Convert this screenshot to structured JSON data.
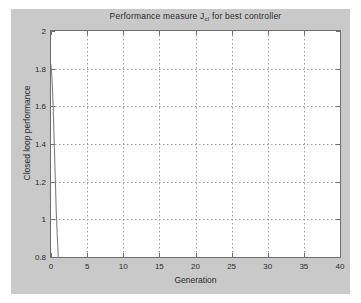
{
  "chart_data": {
    "type": "line",
    "title": "Performance measure J",
    "title_subscript": "cl",
    "title_suffix": " for best controller",
    "title_full": "Performance measure J_cl for best controller",
    "xlabel": "Generation",
    "ylabel": "Closed loop performance",
    "xlim": [
      0,
      40
    ],
    "ylim": [
      0.8,
      2
    ],
    "xticks": [
      "0",
      "5",
      "10",
      "15",
      "20",
      "25",
      "30",
      "35",
      "40"
    ],
    "xtick_values": [
      0,
      5,
      10,
      15,
      20,
      25,
      30,
      35,
      40
    ],
    "yticks": [
      "0.8",
      "1",
      "1.2",
      "1.4",
      "1.6",
      "1.8",
      "2"
    ],
    "ytick_values": [
      0.8,
      1.0,
      1.2,
      1.4,
      1.6,
      1.8,
      2.0
    ],
    "grid": true,
    "grid_style": "dotted",
    "legend": null,
    "series": [
      {
        "name": "best controller performance",
        "color": "#808080",
        "x": [
          0,
          0.15,
          0.3,
          0.45,
          0.6,
          0.72,
          0.85,
          1.0,
          1.2,
          2,
          3,
          4,
          5,
          5.6,
          6,
          7,
          8,
          9,
          10,
          11,
          12,
          13,
          14,
          15,
          15.4,
          16,
          17,
          18,
          20,
          22,
          24,
          26,
          28,
          30,
          32,
          34,
          36,
          38,
          40
        ],
        "y": [
          1.82,
          1.74,
          1.6,
          1.4,
          1.21,
          1.05,
          0.93,
          0.795,
          0.79,
          0.79,
          0.79,
          0.79,
          0.79,
          0.787,
          0.766,
          0.766,
          0.766,
          0.766,
          0.766,
          0.766,
          0.766,
          0.766,
          0.766,
          0.766,
          0.764,
          0.755,
          0.755,
          0.755,
          0.755,
          0.755,
          0.755,
          0.755,
          0.755,
          0.755,
          0.755,
          0.755,
          0.755,
          0.755,
          0.755
        ]
      }
    ],
    "colors": {
      "figure_background": "#c9c9c9",
      "axes_background": "#ffffff",
      "axis_line": "#6e6e6e",
      "grid": "#9a9a9a",
      "line": "#808080",
      "text": "#2b2b2b"
    }
  }
}
